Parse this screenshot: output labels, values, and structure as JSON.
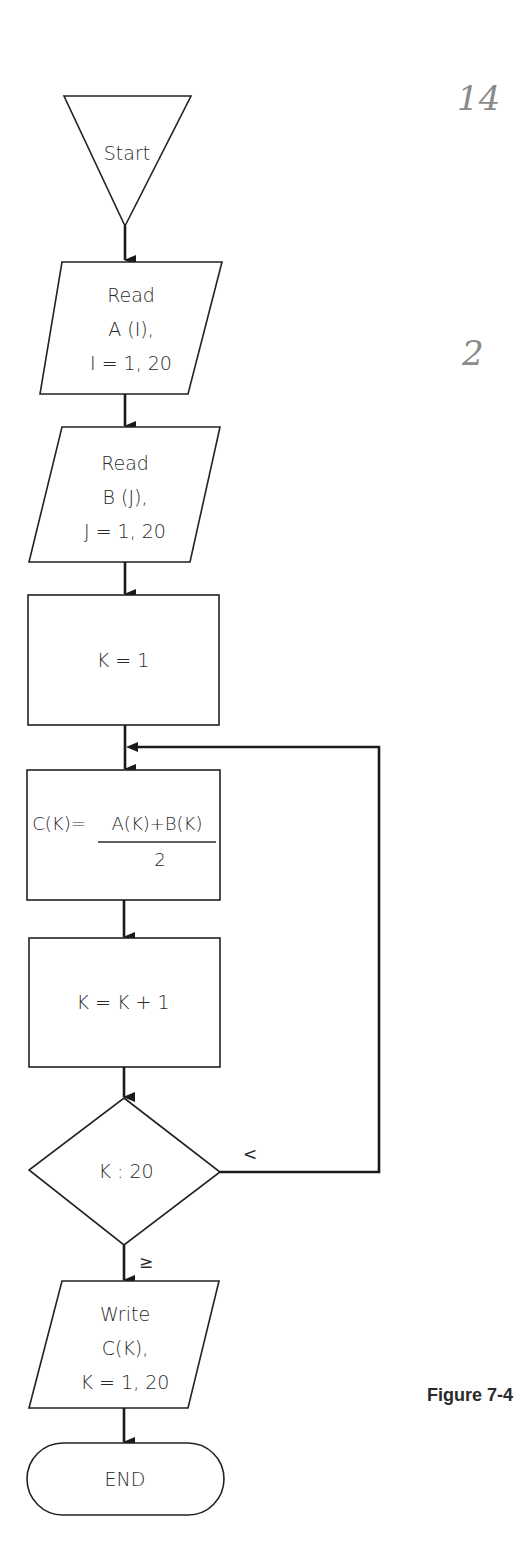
{
  "figure": {
    "caption": "Figure 7-4",
    "annotations": {
      "page_mark": "14",
      "mark_2": "2"
    }
  },
  "nodes": {
    "start": {
      "type": "terminal-triangle",
      "label": "Start"
    },
    "read_a": {
      "type": "io",
      "lines": [
        "Read",
        "A (I),",
        "I = 1, 20"
      ]
    },
    "read_b": {
      "type": "io",
      "lines": [
        "Read",
        "B (J),",
        "J = 1, 20"
      ]
    },
    "init_k": {
      "type": "process",
      "label": "K = 1"
    },
    "compute_c": {
      "type": "process",
      "lhs": "C(K)=",
      "numerator": "A(K)+B(K)",
      "denominator": "2"
    },
    "inc_k": {
      "type": "process",
      "label": "K = K + 1"
    },
    "test_k": {
      "type": "decision",
      "label": "K : 20"
    },
    "write_c": {
      "type": "io",
      "lines": [
        "Write",
        "C(K),",
        "K = 1, 20"
      ]
    },
    "end": {
      "type": "terminal",
      "label": "END"
    }
  },
  "edges": {
    "loop_label": "<",
    "exit_label": "≥"
  }
}
